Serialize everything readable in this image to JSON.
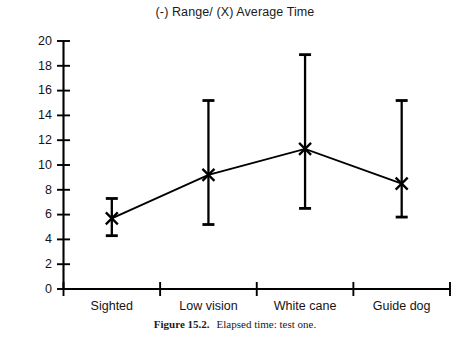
{
  "chart_data": {
    "type": "line",
    "title": "(-) Range/ (X) Average Time",
    "xlabel": "",
    "ylabel": "Minutes",
    "categories": [
      "Sighted",
      "Low vision",
      "White cane",
      "Guide dog"
    ],
    "series": [
      {
        "name": "Average Time",
        "marker": "X",
        "values": [
          5.7,
          9.2,
          11.3,
          8.5
        ]
      }
    ],
    "range_low": [
      4.3,
      5.2,
      6.5,
      5.8
    ],
    "range_high": [
      7.3,
      15.2,
      18.9,
      15.2
    ],
    "ylim": [
      0,
      20
    ],
    "ytick_values": [
      0,
      2,
      4,
      6,
      8,
      10,
      12,
      14,
      16,
      18,
      20
    ],
    "ytick_labels": [
      "0",
      "2",
      "4",
      "6",
      "8",
      "10",
      "12",
      "14",
      "16",
      "18",
      "20"
    ],
    "grid": false,
    "legend": "none",
    "legend_note": "(-) Range/ (X) Average Time"
  },
  "caption": {
    "label": "Figure 15.2.",
    "text": "Elapsed time: test one."
  }
}
